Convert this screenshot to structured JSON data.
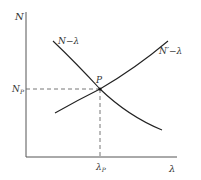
{
  "diagram": {
    "type": "supply-demand style intersection",
    "axes": {
      "y_label": "N",
      "x_label": "λ"
    },
    "curves": [
      {
        "name": "N−λ",
        "label": "N−λ",
        "direction": "decreasing"
      },
      {
        "name": "N'−λ",
        "label": "N′−λ",
        "direction": "increasing"
      }
    ],
    "intersection": {
      "label": "P",
      "y_tick": "N",
      "y_tick_sub": "P",
      "x_tick": "λ",
      "x_tick_sub": "P"
    },
    "colors": {
      "stroke": "#222222",
      "axis": "#555555",
      "dashed": "#666666"
    }
  }
}
